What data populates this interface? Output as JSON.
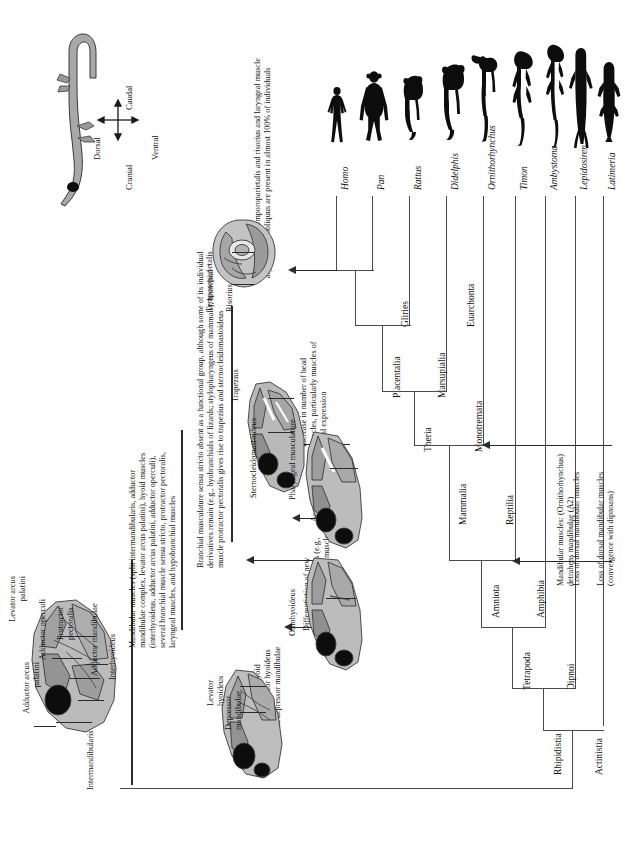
{
  "figure": {
    "type": "cladogram",
    "orientation": "rotated-90-ccw"
  },
  "compass": {
    "dorsal": "Dorsal",
    "ventral": "Ventral",
    "cranial": "Cranial",
    "caudal": "Caudal"
  },
  "taxa": [
    {
      "name": "Homo",
      "silhouette": "human-silhouette"
    },
    {
      "name": "Pan",
      "silhouette": "chimpanzee-silhouette"
    },
    {
      "name": "Rattus",
      "silhouette": "rat-silhouette"
    },
    {
      "name": "Didelphis",
      "silhouette": "opossum-silhouette"
    },
    {
      "name": "Ornithorhynchus",
      "silhouette": "platypus-silhouette"
    },
    {
      "name": "Timon",
      "silhouette": "lizard-silhouette"
    },
    {
      "name": "Ambystoma",
      "silhouette": "salamander-silhouette"
    },
    {
      "name": "Lepidosiren",
      "silhouette": "lungfish-silhouette"
    },
    {
      "name": "Latimeria",
      "silhouette": "coelacanth-silhouette"
    }
  ],
  "clades": [
    {
      "name": "Euarchonta"
    },
    {
      "name": "Gliries"
    },
    {
      "name": "Placentalia"
    },
    {
      "name": "Marsupialia"
    },
    {
      "name": "Theria"
    },
    {
      "name": "Monotremata"
    },
    {
      "name": "Mammalia"
    },
    {
      "name": "Reptilia"
    },
    {
      "name": "Amniota"
    },
    {
      "name": "Amphibia"
    },
    {
      "name": "Tetrapoda"
    },
    {
      "name": "Dipnoi"
    },
    {
      "name": "Rhipidistia"
    },
    {
      "name": "Actinistia"
    }
  ],
  "annotations": [
    {
      "id": "facial-laryngeal",
      "text": "Facial muscles temporoparietalis and risorius and laryngeal muscle arytenoideus obliquus are present in almost 100% of individuals"
    },
    {
      "id": "head-muscle-increase",
      "text": "Increase in number of head muscles, particularly muscles of facial expression"
    },
    {
      "id": "branchial-musculature",
      "text": "Branchial musculature sensu stricto absent as a functional group, although some of its individual derivatives remain (e.g., hyobranchials of lizards; stylopharyngeus of mammals); branchial muscle protractor pectoralis gives rise to trapezius and sternocleidomastoideus"
    },
    {
      "id": "pharyngeal-musculature",
      "text": "Acquisition of complex pharyngeal musculature"
    },
    {
      "id": "hypobranchial",
      "text": "Differentiation of new hypobranchial muscles (e.g., omohyoideus, glossal muscles of tongue)"
    },
    {
      "id": "hyoid-muscles",
      "text": "Acquisition of hyoid muscles levator hyoideus and depressor mandibulae"
    },
    {
      "id": "mandibular-muscles-list",
      "text": "Mandibular muscles (split intermandibularis, adductor mandibulae complex, levator arcus palatini), hyoid muscles (interhyoideus, adductor arcus palatini, adductor operculi), several branchial muscle sensu stricto, protractor pectoralis, laryngeal muscles, and hypobranchial muscles"
    },
    {
      "id": "mandibular-detrahens",
      "text": "Mandibular muscles: (Ornithorhynchus) detrahens mandibulae (A2)"
    },
    {
      "id": "loss-dorsal-dipnoan",
      "text": "Loss of dorsal mandibular muscles (convergence with dipnoans)"
    },
    {
      "id": "loss-dorsal-mandibular",
      "text": "Loss of dorsal mandibular muscles"
    }
  ],
  "muscle_labels": {
    "fish": [
      "Levator arcus palatini",
      "Adductor arcus palatini",
      "Adductor operculi",
      "Protractor pectoralis",
      "Adductor mandibulae",
      "Interhyoideus",
      "Intermandibularis"
    ],
    "amphibian": [
      "Levator hyoideus",
      "Depressor mandibulae"
    ],
    "reptile": [
      "Omohyoideus"
    ],
    "mammal": [
      "Pharyngeal musculature"
    ],
    "primate": [
      "Trapezius",
      "Sternocleidomastoideus",
      "Temporoparietalis",
      "Risorius"
    ]
  },
  "colors": {
    "line": "#4a4a4a",
    "arrow": "#2b2b2b",
    "muscle_light": "#b9b9b9",
    "muscle_mid": "#9a9a9a",
    "muscle_dark": "#7d7d7d",
    "black": "#0d0d0d",
    "background": "#ffffff"
  }
}
